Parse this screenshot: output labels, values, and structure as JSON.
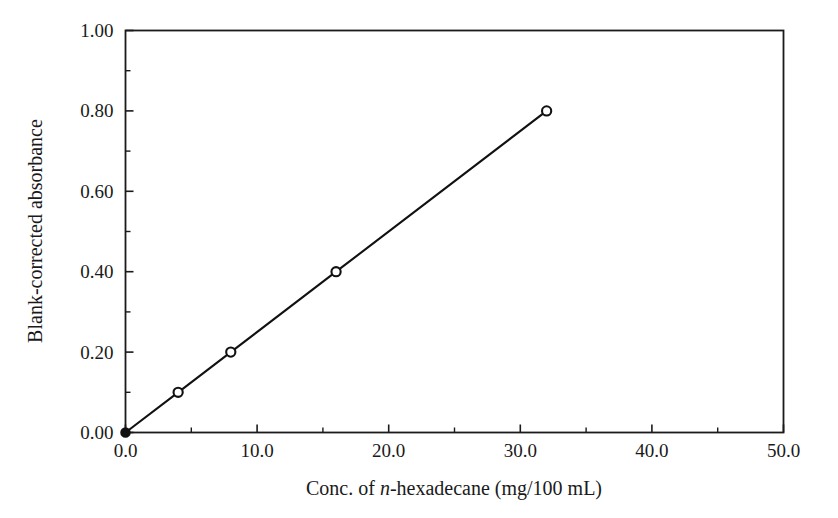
{
  "chart_data": {
    "type": "line",
    "title": "",
    "subtitle": "",
    "xlabel_parts": {
      "before": "Conc. of ",
      "italic": "n",
      "after": "-hexadecane (mg/100 mL)"
    },
    "xlabel": "Conc. of n-hexadecane (mg/100 mL)",
    "ylabel": "Blank-corrected absorbance",
    "xlim": [
      0.0,
      50.0
    ],
    "ylim": [
      0.0,
      1.0
    ],
    "x_major_ticks": [
      0.0,
      10.0,
      20.0,
      30.0,
      40.0,
      50.0
    ],
    "x_major_tick_labels": [
      "0.0",
      "10.0",
      "20.0",
      "30.0",
      "40.0",
      "50.0"
    ],
    "x_minor_ticks": [
      5.0,
      15.0,
      25.0,
      35.0,
      45.0
    ],
    "y_major_ticks": [
      0.0,
      0.2,
      0.4,
      0.6,
      0.8,
      1.0
    ],
    "y_major_tick_labels": [
      "0.00",
      "0.20",
      "0.40",
      "0.60",
      "0.80",
      "1.00"
    ],
    "y_minor_ticks": [
      0.1,
      0.3,
      0.5,
      0.7,
      0.9
    ],
    "grid": false,
    "legend": false,
    "legend_position": "none",
    "tick_direction": "in",
    "frame": "box",
    "line_color": "#111111",
    "marker_edge_color": "#111111",
    "marker_face_color": "#ffffff",
    "series": [
      {
        "name": "Calibration curve",
        "marker": "circle",
        "x": [
          0.0,
          4.0,
          8.0,
          16.0,
          32.0
        ],
        "y": [
          0.0,
          0.1,
          0.2,
          0.4,
          0.8
        ],
        "point_styles": [
          "filled",
          "open",
          "open",
          "open",
          "open"
        ]
      }
    ],
    "annotations": []
  },
  "figure": {
    "background_color": "#ffffff",
    "axis_color": "#1a1a1a"
  }
}
